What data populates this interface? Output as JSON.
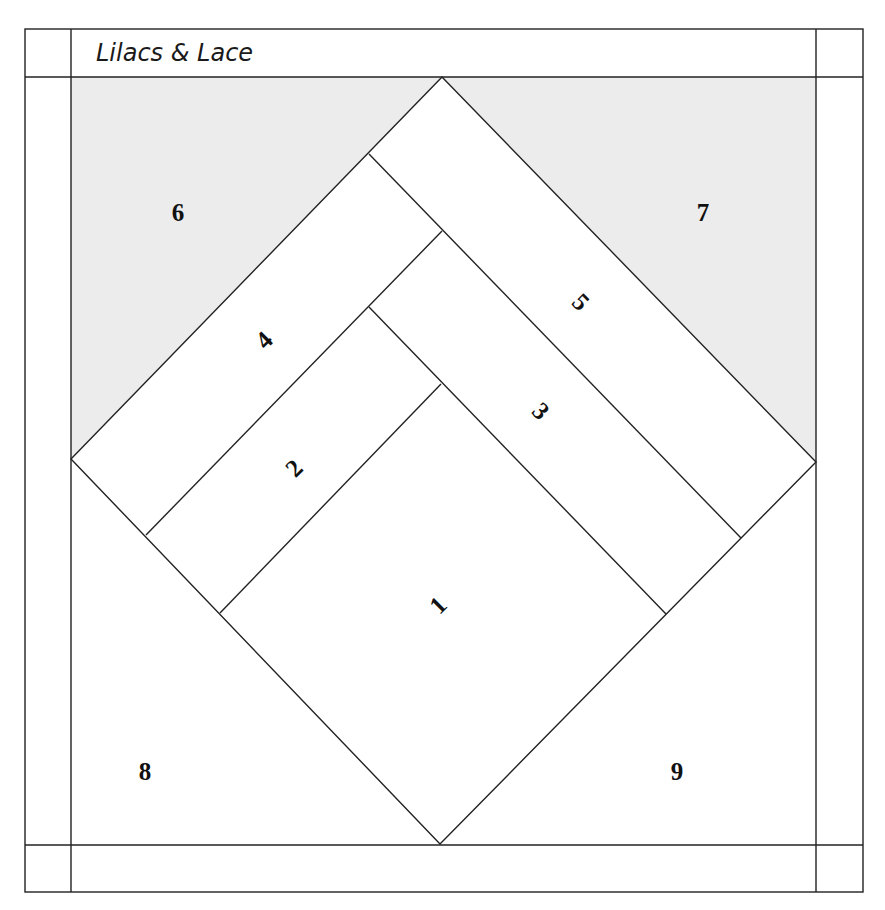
{
  "title": "Lilacs & Lace",
  "colors": {
    "line": "#222222",
    "background_shading": "#ececec",
    "paper": "#ffffff"
  },
  "pattern": {
    "type": "foundation-paper-piecing block",
    "pieces": [
      {
        "id": "1",
        "label": "1",
        "region": "center diamond bottom",
        "rotation": -45
      },
      {
        "id": "2",
        "label": "2",
        "region": "left strip",
        "rotation": -45
      },
      {
        "id": "3",
        "label": "3",
        "region": "right strip",
        "rotation": 45
      },
      {
        "id": "4",
        "label": "4",
        "region": "outer left strip",
        "rotation": -45
      },
      {
        "id": "5",
        "label": "5",
        "region": "outer right strip",
        "rotation": 45
      },
      {
        "id": "6",
        "label": "6",
        "region": "top-left corner triangle (shaded)",
        "rotation": 0
      },
      {
        "id": "7",
        "label": "7",
        "region": "top-right corner triangle (shaded)",
        "rotation": 0
      },
      {
        "id": "8",
        "label": "8",
        "region": "bottom-left corner triangle",
        "rotation": 0
      },
      {
        "id": "9",
        "label": "9",
        "region": "bottom-right corner triangle",
        "rotation": 0
      }
    ]
  },
  "labels": {
    "p1": "1",
    "p2": "2",
    "p3": "3",
    "p4": "4",
    "p5": "5",
    "p6": "6",
    "p7": "7",
    "p8": "8",
    "p9": "9"
  }
}
